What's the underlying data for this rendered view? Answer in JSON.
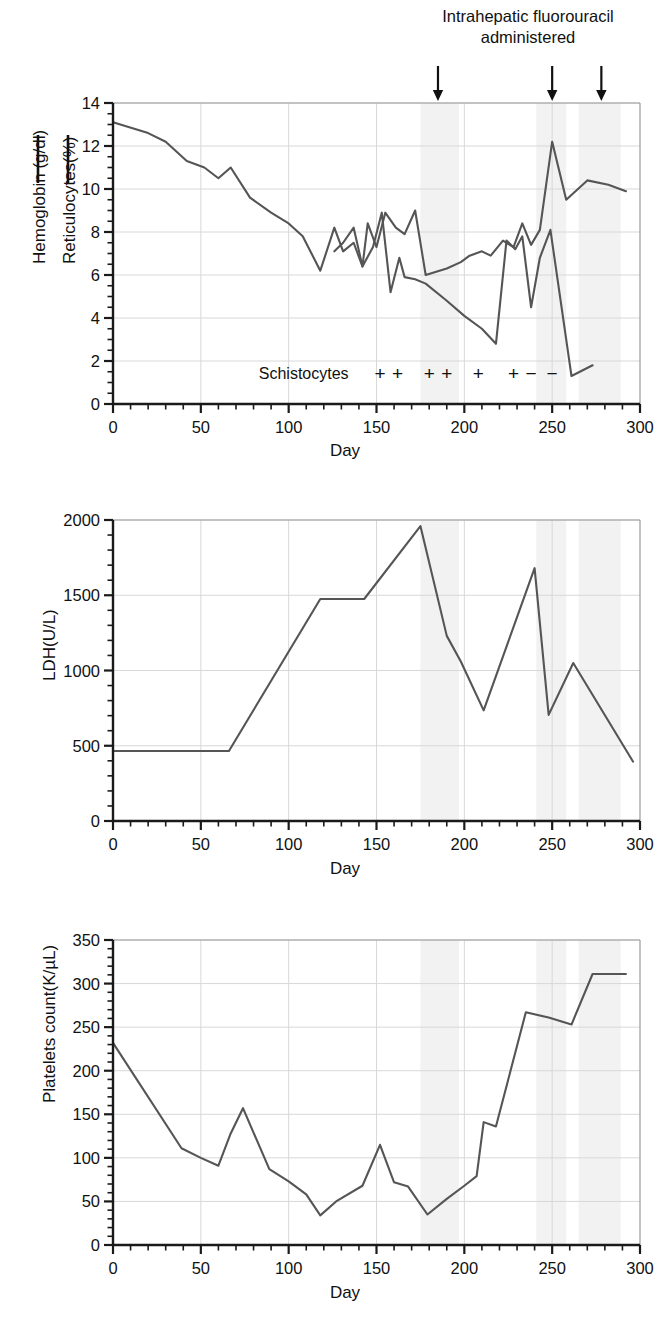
{
  "figure": {
    "annotation": {
      "line1": "Intrahepatic fluorouracil",
      "line2": "administered",
      "arrow_days": [
        185,
        250,
        278
      ]
    },
    "shaded_bands_days": [
      [
        175,
        197
      ],
      [
        241,
        258
      ],
      [
        265,
        289
      ]
    ],
    "shade_color": "#f2f2f2",
    "line_color": "#555555",
    "axis_color": "#1a1a1a",
    "grid_color": "#d8d8d8"
  },
  "panels": [
    {
      "id": "hemoglobin",
      "x_axis_title": "Day",
      "y_axis_line1": "Hemoglobin (g/dl)",
      "y_axis_line2": "Reticulocytes(%)",
      "schistocytes_label": "Schistocytes",
      "schistocytes": [
        {
          "day": 152,
          "symbol": "+"
        },
        {
          "day": 162,
          "symbol": "+"
        },
        {
          "day": 180,
          "symbol": "+"
        },
        {
          "day": 190,
          "symbol": "+"
        },
        {
          "day": 208,
          "symbol": "+"
        },
        {
          "day": 228,
          "symbol": "+"
        },
        {
          "day": 238,
          "symbol": "−"
        },
        {
          "day": 250,
          "symbol": "−"
        }
      ]
    },
    {
      "id": "ldh",
      "x_axis_title": "Day",
      "y_axis_title": "LDH(U/L)"
    },
    {
      "id": "platelets",
      "x_axis_title": "Day",
      "y_axis_title": "Platelets count(K/µL)"
    }
  ],
  "chart_data": [
    {
      "type": "line",
      "title": "Intrahepatic fluorouracil administered",
      "xlabel": "Day",
      "ylabel": "Hemoglobin (g/dl)  Reticulocytes(%)",
      "xlim": [
        0,
        300
      ],
      "ylim": [
        0,
        14
      ],
      "xticks": [
        0,
        50,
        100,
        150,
        200,
        250,
        300
      ],
      "yticks": [
        0,
        2,
        4,
        6,
        8,
        10,
        12,
        14
      ],
      "x_minor_step": 10,
      "y_minor_step": 0.5,
      "grid": true,
      "legend": [
        "Hemoglobin (g/dl)",
        "Reticulocytes(%)"
      ],
      "legend_position": "left-outside",
      "series": [
        {
          "name": "Hemoglobin (g/dl)",
          "points": [
            [
              0,
              13.1
            ],
            [
              20,
              12.6
            ],
            [
              30,
              12.2
            ],
            [
              42,
              11.3
            ],
            [
              52,
              11.0
            ],
            [
              60,
              10.5
            ],
            [
              67,
              11.0
            ],
            [
              78,
              9.6
            ],
            [
              90,
              8.9
            ],
            [
              100,
              8.4
            ],
            [
              108,
              7.8
            ],
            [
              118,
              6.2
            ],
            [
              126,
              8.2
            ],
            [
              131,
              7.1
            ],
            [
              137,
              7.5
            ],
            [
              142,
              6.4
            ],
            [
              145,
              8.4
            ],
            [
              150,
              7.3
            ],
            [
              155,
              8.9
            ],
            [
              161,
              8.2
            ],
            [
              166,
              7.9
            ],
            [
              172,
              9.0
            ],
            [
              178,
              6.0
            ],
            [
              190,
              6.3
            ],
            [
              198,
              6.6
            ],
            [
              203,
              6.9
            ],
            [
              210,
              7.1
            ],
            [
              215,
              6.9
            ],
            [
              222,
              7.6
            ],
            [
              228,
              7.3
            ],
            [
              233,
              8.4
            ],
            [
              238,
              7.4
            ],
            [
              243,
              8.1
            ],
            [
              250,
              12.2
            ],
            [
              258,
              9.5
            ],
            [
              270,
              10.4
            ],
            [
              282,
              10.2
            ],
            [
              292,
              9.9
            ]
          ]
        },
        {
          "name": "Reticulocytes(%)",
          "points": [
            [
              126,
              7.1
            ],
            [
              131,
              7.5
            ],
            [
              137,
              8.2
            ],
            [
              142,
              6.4
            ],
            [
              148,
              7.3
            ],
            [
              153,
              8.9
            ],
            [
              158,
              5.2
            ],
            [
              163,
              6.8
            ],
            [
              166,
              5.9
            ],
            [
              172,
              5.8
            ],
            [
              178,
              5.6
            ],
            [
              190,
              4.8
            ],
            [
              200,
              4.1
            ],
            [
              210,
              3.5
            ],
            [
              218,
              2.8
            ],
            [
              224,
              7.6
            ],
            [
              229,
              7.2
            ],
            [
              233,
              7.8
            ],
            [
              238,
              4.5
            ],
            [
              243,
              6.8
            ],
            [
              249,
              8.1
            ],
            [
              261,
              1.3
            ],
            [
              273,
              1.8
            ]
          ]
        }
      ]
    },
    {
      "type": "line",
      "title": "",
      "xlabel": "Day",
      "ylabel": "LDH(U/L)",
      "xlim": [
        0,
        300
      ],
      "ylim": [
        0,
        2000
      ],
      "xticks": [
        0,
        50,
        100,
        150,
        200,
        250,
        300
      ],
      "yticks": [
        0,
        500,
        1000,
        1500,
        2000
      ],
      "x_minor_step": 10,
      "y_minor_step": 100,
      "grid": true,
      "series": [
        {
          "name": "LDH(U/L)",
          "points": [
            [
              0,
              465
            ],
            [
              40,
              465
            ],
            [
              66,
              465
            ],
            [
              118,
              1475
            ],
            [
              143,
              1475
            ],
            [
              175,
              1960
            ],
            [
              190,
              1230
            ],
            [
              198,
              1060
            ],
            [
              211,
              735
            ],
            [
              240,
              1680
            ],
            [
              248,
              705
            ],
            [
              262,
              1050
            ],
            [
              296,
              395
            ]
          ]
        }
      ]
    },
    {
      "type": "line",
      "title": "",
      "xlabel": "Day",
      "ylabel": "Platelets count(K/µL)",
      "xlim": [
        0,
        300
      ],
      "ylim": [
        0,
        350
      ],
      "xticks": [
        0,
        50,
        100,
        150,
        200,
        250,
        300
      ],
      "yticks": [
        0,
        50,
        100,
        150,
        200,
        250,
        300,
        350
      ],
      "x_minor_step": 10,
      "y_minor_step": 10,
      "grid": true,
      "series": [
        {
          "name": "Platelets count(K/µL)",
          "points": [
            [
              0,
              232
            ],
            [
              39,
              111
            ],
            [
              50,
              100
            ],
            [
              60,
              91
            ],
            [
              67,
              128
            ],
            [
              74,
              157
            ],
            [
              89,
              87
            ],
            [
              100,
              73
            ],
            [
              110,
              58
            ],
            [
              118,
              34
            ],
            [
              127,
              50
            ],
            [
              142,
              68
            ],
            [
              152,
              115
            ],
            [
              160,
              72
            ],
            [
              168,
              67
            ],
            [
              179,
              35
            ],
            [
              190,
              53
            ],
            [
              200,
              68
            ],
            [
              207,
              79
            ],
            [
              211,
              141
            ],
            [
              218,
              136
            ],
            [
              235,
              267
            ],
            [
              248,
              261
            ],
            [
              261,
              253
            ],
            [
              273,
              311
            ],
            [
              292,
              311
            ]
          ]
        }
      ]
    }
  ]
}
